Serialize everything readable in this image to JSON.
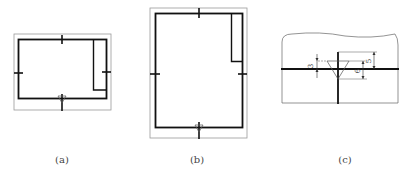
{
  "figure": {
    "panels": [
      {
        "id": "a",
        "caption": "(a)",
        "description": "Landscape drawing sheet with border frame, title block at right, centering marks and orientation mark"
      },
      {
        "id": "b",
        "caption": "(b)",
        "description": "Portrait drawing sheet with border frame, title block at top right, centering marks and orientation mark"
      },
      {
        "id": "c",
        "caption": "(c)",
        "description": "Detail of orientation mark: triangle on centering mark with dimensions"
      }
    ],
    "detail_dimensions": [
      "3",
      "5",
      "6"
    ],
    "colors": {
      "line": "#111111",
      "thin": "#888888",
      "background": "#ffffff"
    }
  }
}
